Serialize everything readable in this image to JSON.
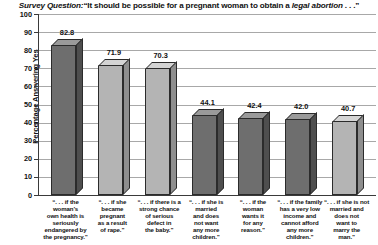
{
  "chart_data": {
    "type": "bar",
    "title_parts": {
      "lead_italic": "Survey Question:",
      "quote_open": "“It should be possible for a pregnant woman to obtain a ",
      "emphasis": "legal abortion",
      "quote_close": " . . .”"
    },
    "xlabel": "",
    "ylabel": "Percentage Answering Yes",
    "ylim": [
      0,
      100
    ],
    "ytick_step": 10,
    "yticks": [
      100,
      90,
      80,
      70,
      60,
      50,
      40,
      30,
      20,
      10,
      0
    ],
    "grid": true,
    "legend": "none",
    "categories": [
      "“. . . if the woman’s own health is seriously endangered by the pregnancy.”",
      "“. . . if she became pregnant as a result of rape.”",
      "“. . . if there is a strong chance of serious defect in the baby.”",
      "“. . . if she is married and does not want any more children.”",
      "“. . . if the woman wants it for any reason.”",
      "“. . . if the family has a very low income and cannot afford any more children.”",
      "“. . . if she is not married and does not want to marry the man.”"
    ],
    "category_lines": [
      [
        "“. . . if the",
        "woman’s",
        "own health is",
        "seriously",
        "endangered by",
        "the pregnancy.”"
      ],
      [
        "“. . . if she",
        "became",
        "pregnant",
        "as a result",
        "of rape.”"
      ],
      [
        "“. . . if there is a",
        "strong chance",
        "of serious",
        "defect in",
        "the baby.”"
      ],
      [
        "“. . . if she is",
        "married",
        "and does",
        "not want",
        "any more",
        "children.”"
      ],
      [
        "“. . . if the",
        "woman",
        "wants it",
        "for any",
        "reason.”"
      ],
      [
        "“. . . if the family",
        "has a very low",
        "income and",
        "cannot afford",
        "any more",
        "children.”"
      ],
      [
        "“. . . if she is not",
        "married and",
        "does not",
        "want to",
        "marry the",
        "man.”"
      ]
    ],
    "values": [
      82.8,
      71.9,
      70.3,
      44.1,
      42.4,
      42.0,
      40.7
    ],
    "value_labels": [
      "82.8",
      "71.9",
      "70.3",
      "44.1",
      "42.4",
      "42.0",
      "40.7"
    ],
    "bar_shades": [
      "dark",
      "light",
      "light",
      "dark",
      "dark",
      "dark",
      "light"
    ],
    "colors": {
      "bar_dark_front": "#6e6e6e",
      "bar_dark_top": "#9a9a9a",
      "bar_dark_side": "#4e4e4e",
      "bar_light_front": "#b4b4b4",
      "bar_light_top": "#d4d4d4",
      "bar_light_side": "#8e8e8e",
      "grid": "#a8a8a8",
      "axis": "#3a3a3a",
      "text": "#111111",
      "background": "#ffffff"
    }
  }
}
